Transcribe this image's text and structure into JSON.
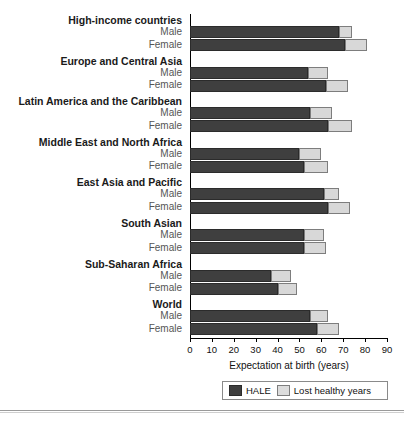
{
  "chart_data": {
    "type": "bar",
    "orientation": "horizontal",
    "stacked": true,
    "title": "",
    "xlabel": "Expectation at birth (years)",
    "ylabel": "",
    "xlim": [
      0,
      90
    ],
    "xticks": [
      0,
      10,
      20,
      30,
      40,
      50,
      60,
      70,
      80,
      90
    ],
    "grid": false,
    "legend_position": "bottom",
    "series": [
      {
        "name": "HALE",
        "color": "#3f3f3f"
      },
      {
        "name": "Lost healthy years",
        "color": "#d8d8d8"
      }
    ],
    "groups": [
      {
        "label": "High-income countries",
        "rows": [
          {
            "label": "Male",
            "hale": 68,
            "lost": 6,
            "total": 74
          },
          {
            "label": "Female",
            "hale": 71,
            "lost": 10,
            "total": 81
          }
        ]
      },
      {
        "label": "Europe and Central Asia",
        "rows": [
          {
            "label": "Male",
            "hale": 54,
            "lost": 9,
            "total": 63
          },
          {
            "label": "Female",
            "hale": 62,
            "lost": 10,
            "total": 72
          }
        ]
      },
      {
        "label": "Latin America and the Caribbean",
        "rows": [
          {
            "label": "Male",
            "hale": 55,
            "lost": 10,
            "total": 65
          },
          {
            "label": "Female",
            "hale": 63,
            "lost": 11,
            "total": 74
          }
        ]
      },
      {
        "label": "Middle East and North Africa",
        "rows": [
          {
            "label": "Male",
            "hale": 50,
            "lost": 10,
            "total": 60
          },
          {
            "label": "Female",
            "hale": 52,
            "lost": 11,
            "total": 63
          }
        ]
      },
      {
        "label": "East Asia and Pacific",
        "rows": [
          {
            "label": "Male",
            "hale": 61,
            "lost": 7,
            "total": 68
          },
          {
            "label": "Female",
            "hale": 63,
            "lost": 10,
            "total": 73
          }
        ]
      },
      {
        "label": "South Asian",
        "rows": [
          {
            "label": "Male",
            "hale": 52,
            "lost": 9,
            "total": 61
          },
          {
            "label": "Female",
            "hale": 52,
            "lost": 10,
            "total": 62
          }
        ]
      },
      {
        "label": "Sub-Saharan Africa",
        "rows": [
          {
            "label": "Male",
            "hale": 37,
            "lost": 9,
            "total": 46
          },
          {
            "label": "Female",
            "hale": 40,
            "lost": 9,
            "total": 49
          }
        ]
      },
      {
        "label": "World",
        "rows": [
          {
            "label": "Male",
            "hale": 55,
            "lost": 8,
            "total": 63
          },
          {
            "label": "Female",
            "hale": 58,
            "lost": 10,
            "total": 68
          }
        ]
      }
    ]
  },
  "axis": {
    "title": "Expectation at birth (years)",
    "ticks": [
      "0",
      "10",
      "20",
      "30",
      "40",
      "50",
      "60",
      "70",
      "80",
      "90"
    ]
  },
  "legend": {
    "hale_label": "HALE",
    "lost_label": "Lost healthy years"
  },
  "colors": {
    "hale": "#3f3f3f",
    "lost": "#d8d8d8",
    "axis": "#000000",
    "background": "#ffffff"
  }
}
